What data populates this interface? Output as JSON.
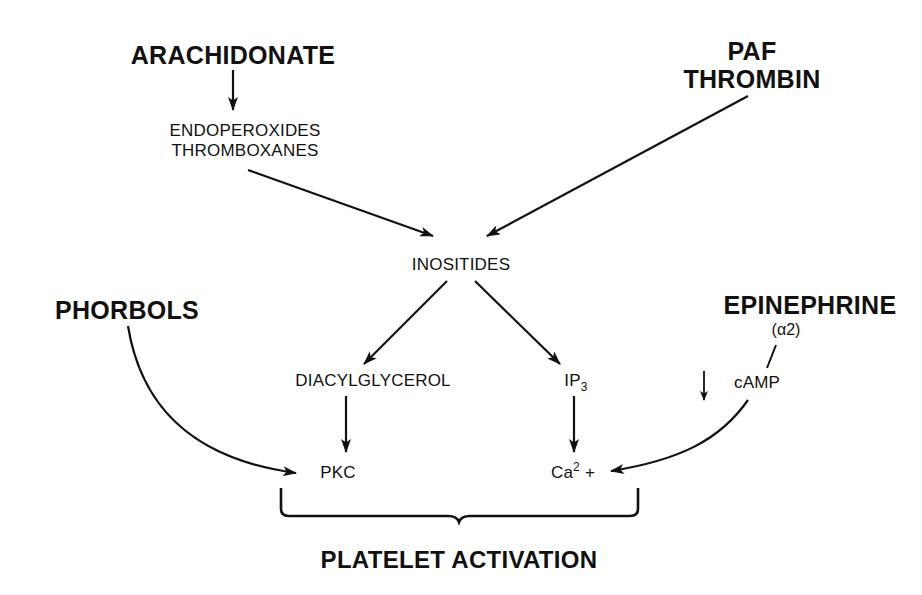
{
  "diagram": {
    "type": "signaling-pathway",
    "nodes": {
      "arachidonate": "ARACHIDONATE",
      "endoperoxides": "ENDOPEROXIDES",
      "thromboxanes": "THROMBOXANES",
      "paf": "PAF",
      "thrombin": "THROMBIN",
      "inositides": "INOSITIDES",
      "phorbols": "PHORBOLS",
      "epinephrine": "EPINEPHRINE",
      "alpha2": "(α2)",
      "diacylglycerol": "DIACYLGLYCEROL",
      "ip3_base": "IP",
      "ip3_sub": "3",
      "camp": "cAMP",
      "camp_down_indicator": "↓",
      "pkc": "PKC",
      "ca_base": "Ca",
      "ca_sup": "2",
      "ca_plus": " +",
      "outcome": "PLATELET ACTIVATION"
    },
    "edges": [
      {
        "from": "ARACHIDONATE",
        "to": "ENDOPEROXIDES / THROMBOXANES"
      },
      {
        "from": "ENDOPEROXIDES / THROMBOXANES",
        "to": "INOSITIDES"
      },
      {
        "from": "PAF / THROMBIN",
        "to": "INOSITIDES"
      },
      {
        "from": "INOSITIDES",
        "to": "DIACYLGLYCEROL"
      },
      {
        "from": "INOSITIDES",
        "to": "IP3"
      },
      {
        "from": "DIACYLGLYCEROL",
        "to": "PKC"
      },
      {
        "from": "IP3",
        "to": "Ca2+"
      },
      {
        "from": "PHORBOLS",
        "to": "PKC"
      },
      {
        "from": "EPINEPHRINE (α2)",
        "to": "cAMP"
      },
      {
        "from": "cAMP",
        "to": "Ca2+"
      },
      {
        "from": "PKC + Ca2+",
        "to": "PLATELET ACTIVATION",
        "style": "brace"
      }
    ],
    "colors": {
      "ink": "#111111",
      "background": "#ffffff"
    }
  }
}
